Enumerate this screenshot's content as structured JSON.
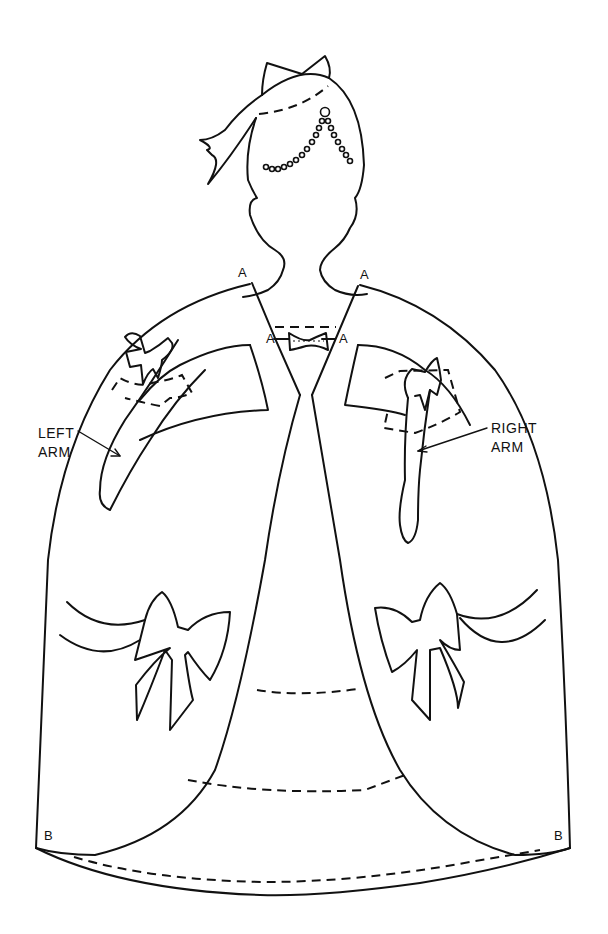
{
  "figure": {
    "stroke_color": "#111111",
    "background": "#ffffff"
  },
  "labels": {
    "left_arm": [
      "LEFT",
      "ARM"
    ],
    "right_arm": [
      "RIGHT",
      "ARM"
    ],
    "point_a": "A",
    "point_b": "B"
  },
  "parts": [
    {
      "name": "head-with-hair-bow",
      "icon": "head-silhouette"
    },
    {
      "name": "bodice-bow",
      "icon": "bow"
    },
    {
      "name": "left-arm",
      "icon": "arm-with-bow"
    },
    {
      "name": "right-arm",
      "icon": "arm-with-bow"
    },
    {
      "name": "left-skirt-panel",
      "icon": "skirt-panel-with-bow"
    },
    {
      "name": "right-skirt-panel",
      "icon": "skirt-panel-with-bow"
    },
    {
      "name": "underskirt",
      "icon": "underskirt-with-fold-lines"
    }
  ]
}
